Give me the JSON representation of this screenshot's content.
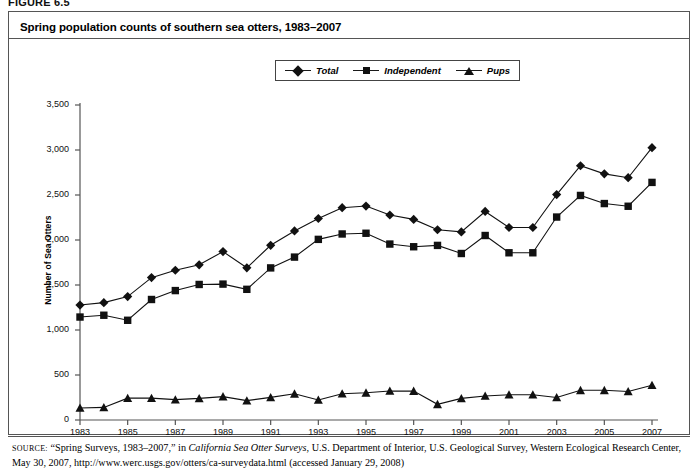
{
  "figure": {
    "label": "FIGURE 6.5",
    "title": "Spring population counts of southern sea otters, 1983–2007"
  },
  "legend": {
    "position": "top-center",
    "items": [
      {
        "label": "Total",
        "marker": "diamond-marker-icon",
        "color": "#111111"
      },
      {
        "label": "Independent",
        "marker": "square-marker-icon",
        "color": "#111111"
      },
      {
        "label": "Pups",
        "marker": "triangle-marker-icon",
        "color": "#111111"
      }
    ]
  },
  "source": {
    "prefix": "SOURCE:",
    "line1_a": " “Spring Surveys, 1983–2007,” in ",
    "line1_italic": "California Sea Otter Surveys",
    "line1_b": ", U.S. Department of Interior, U.S. Geological Survey, Western Ecological Research",
    "line2": "Center, May 30, 2007, http://www.werc.usgs.gov/otters/ca-surveydata.html (accessed January 29, 2008)"
  },
  "chart_data": {
    "type": "line",
    "title": "Spring population counts of southern sea otters, 1983–2007",
    "xlabel": "",
    "ylabel": "Number of Sea Otters",
    "ylim": [
      0,
      3500
    ],
    "yticks": [
      "0",
      "500",
      "1,000",
      "1,500",
      "2,000",
      "2,500",
      "3,000",
      "3,500"
    ],
    "ytick_values": [
      0,
      500,
      1000,
      1500,
      2000,
      2500,
      3000,
      3500
    ],
    "xlim": [
      1983,
      2007
    ],
    "xticks": [
      "1983",
      "1985",
      "1987",
      "1989",
      "1991",
      "1993",
      "1995",
      "1997",
      "1999",
      "2001",
      "2003",
      "2005",
      "2007"
    ],
    "xtick_values": [
      1983,
      1985,
      1987,
      1989,
      1991,
      1993,
      1995,
      1997,
      1999,
      2001,
      2003,
      2005,
      2007
    ],
    "x": [
      1983,
      1984,
      1985,
      1986,
      1987,
      1988,
      1989,
      1990,
      1991,
      1992,
      1993,
      1994,
      1995,
      1996,
      1997,
      1998,
      1999,
      2000,
      2001,
      2002,
      2003,
      2004,
      2005,
      2006,
      2007
    ],
    "grid": false,
    "legend_position": "top-center",
    "series": [
      {
        "name": "Total",
        "marker": "diamond",
        "color": "#111111",
        "values": [
          1277,
          1304,
          1371,
          1582,
          1664,
          1724,
          1871,
          1691,
          1941,
          2101,
          2239,
          2359,
          2377,
          2278,
          2229,
          2114,
          2090,
          2317,
          2139,
          2139,
          2505,
          2825,
          2735,
          2692,
          3026
        ]
      },
      {
        "name": "Independent",
        "marker": "square",
        "color": "#111111",
        "values": [
          1144,
          1164,
          1108,
          1339,
          1438,
          1506,
          1510,
          1452,
          1690,
          1810,
          2007,
          2067,
          2075,
          1955,
          1925,
          1940,
          1850,
          2050,
          1858,
          1858,
          2255,
          2495,
          2405,
          2375,
          2640
        ]
      },
      {
        "name": "Pups",
        "marker": "triangle",
        "color": "#111111",
        "values": [
          133,
          140,
          243,
          243,
          226,
          240,
          260,
          215,
          251,
          291,
          222,
          292,
          302,
          323,
          321,
          174,
          240,
          267,
          281,
          281,
          250,
          330,
          330,
          317,
          386
        ]
      }
    ]
  }
}
